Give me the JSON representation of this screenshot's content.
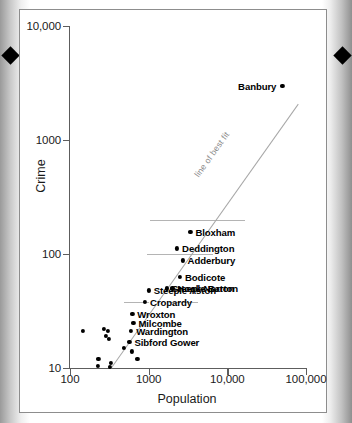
{
  "figure": {
    "registration_marks": [
      "diamond-left",
      "diamond-right"
    ]
  },
  "chart_data": {
    "type": "scatter",
    "title": "",
    "xlabel": "Population",
    "ylabel": "Crime",
    "xscale": "log",
    "yscale": "log",
    "xlim": [
      100,
      100000
    ],
    "ylim": [
      10,
      10000
    ],
    "xticks": [
      "100",
      "1000",
      "10,000",
      "100,000"
    ],
    "xtick_values": [
      100,
      1000,
      10000,
      100000
    ],
    "yticks": [
      "10",
      "100",
      "1000",
      "10,000"
    ],
    "ytick_values": [
      10,
      100,
      1000,
      10000
    ],
    "grid": false,
    "legend": null,
    "annotations": [
      {
        "text": "line of best fit",
        "kind": "trendline-label"
      }
    ],
    "series": [
      {
        "name": "Oxfordshire settlements",
        "marker": "filled-circle",
        "color": "#000000",
        "points": [
          {
            "label": "Banbury",
            "population": 50000,
            "crime": 3000,
            "label_side": "left"
          },
          {
            "label": "Bloxham",
            "population": 3400,
            "crime": 155,
            "label_side": "right"
          },
          {
            "label": "Deddington",
            "population": 2300,
            "crime": 112,
            "label_side": "right"
          },
          {
            "label": "Adderbury",
            "population": 2700,
            "crime": 88,
            "label_side": "right"
          },
          {
            "label": "Bodicote",
            "population": 2500,
            "crime": 63,
            "label_side": "right"
          },
          {
            "label": "Hook Norton",
            "population": 2000,
            "crime": 50,
            "label_side": "right"
          },
          {
            "label": "Steeple Barton",
            "population": 1700,
            "crime": 50,
            "label_side": "right"
          },
          {
            "label": "Steeple Aston",
            "population": 1000,
            "crime": 48,
            "label_side": "right"
          },
          {
            "label": "Cropardy",
            "population": 900,
            "crime": 38,
            "label_side": "right"
          },
          {
            "label": "Wroxton",
            "population": 620,
            "crime": 30,
            "label_side": "right"
          },
          {
            "label": "Milcombe",
            "population": 640,
            "crime": 25,
            "label_side": "right"
          },
          {
            "label": "Wardington",
            "population": 600,
            "crime": 21,
            "label_side": "right"
          },
          {
            "label": "Sibford Gower",
            "population": 570,
            "crime": 17,
            "label_side": "right"
          },
          {
            "label": "",
            "population": 145,
            "crime": 21,
            "label_side": "none"
          },
          {
            "label": "",
            "population": 270,
            "crime": 22,
            "label_side": "none"
          },
          {
            "label": "",
            "population": 300,
            "crime": 21,
            "label_side": "none"
          },
          {
            "label": "",
            "population": 285,
            "crime": 19,
            "label_side": "none"
          },
          {
            "label": "",
            "population": 310,
            "crime": 18,
            "label_side": "none"
          },
          {
            "label": "",
            "population": 480,
            "crime": 15,
            "label_side": "none"
          },
          {
            "label": "",
            "population": 615,
            "crime": 14,
            "label_side": "none"
          },
          {
            "label": "",
            "population": 720,
            "crime": 12,
            "label_side": "none"
          },
          {
            "label": "",
            "population": 230,
            "crime": 12,
            "label_side": "none"
          },
          {
            "label": "",
            "population": 225,
            "crime": 10.4,
            "label_side": "none"
          },
          {
            "label": "",
            "population": 330,
            "crime": 11,
            "label_side": "none"
          },
          {
            "label": "",
            "population": 320,
            "crime": 10.3,
            "label_side": "none"
          }
        ]
      }
    ],
    "trendline": {
      "label": "line of best fit",
      "x_start": 330,
      "y_start": 10,
      "x_end": 80000,
      "y_end": 2100
    },
    "leader_rules": [
      {
        "crime_level": 200,
        "x_start": 1050,
        "x_end": 17000
      },
      {
        "crime_level": 100,
        "x_start": 950,
        "x_end": 6500
      },
      {
        "crime_level": 38,
        "x_start": 480,
        "x_end": 1000
      },
      {
        "crime_level": 38,
        "x_start": 1800,
        "x_end": 4200
      }
    ]
  }
}
